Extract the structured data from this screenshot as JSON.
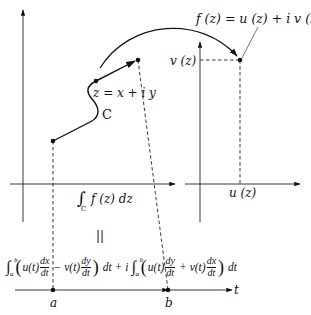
{
  "labels": {
    "z_point": "z = x + i y",
    "curve": "C",
    "mapping": "f (z) = u (z) + i v (z)",
    "v_axis": "v (z)",
    "u_axis": "u (z)",
    "integral_left": "∫",
    "integral_sub": "C",
    "integral_body": "f (z) dz",
    "equals": "||",
    "t_axis": "t",
    "a": "a",
    "b": "b"
  },
  "formula": {
    "int1_upper": "b",
    "int1_lower": "a",
    "term1_u": "u(t)",
    "dx": "dx",
    "dt": "dt",
    "minus": "−",
    "term1_v": "v(t)",
    "dy": "dy",
    "dt_end": "dt",
    "plus_i": "+ i",
    "int2_upper": "b",
    "int2_lower": "a",
    "term2_u": "u(t)",
    "plus": "+",
    "term2_v": "v(t)"
  }
}
